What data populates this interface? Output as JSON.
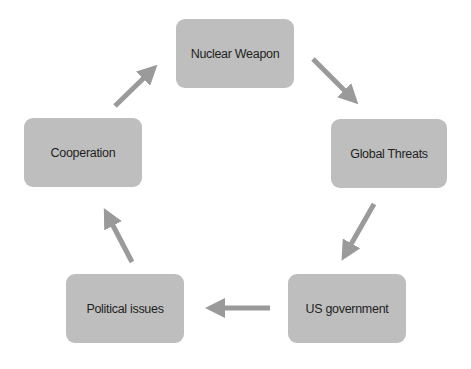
{
  "diagram": {
    "type": "cycle",
    "colors": {
      "node_fill": "#bebebe",
      "arrow": "#9a9a9a",
      "text": "#1e1e1e",
      "background": "#ffffff"
    },
    "nodes": [
      {
        "id": "nuclear",
        "label": "Nuclear Weapon",
        "x": 176,
        "y": 19,
        "w": 118,
        "h": 69
      },
      {
        "id": "global",
        "label": "Global Threats",
        "x": 331,
        "y": 119,
        "w": 116,
        "h": 69
      },
      {
        "id": "us",
        "label": "US government",
        "x": 288,
        "y": 274,
        "w": 118,
        "h": 69
      },
      {
        "id": "political",
        "label": "Political issues",
        "x": 66,
        "y": 274,
        "w": 118,
        "h": 69
      },
      {
        "id": "cooperation",
        "label": "Cooperation",
        "x": 24,
        "y": 118,
        "w": 118,
        "h": 69
      }
    ],
    "edges": [
      {
        "from": "nuclear",
        "to": "global"
      },
      {
        "from": "global",
        "to": "us"
      },
      {
        "from": "us",
        "to": "political"
      },
      {
        "from": "political",
        "to": "cooperation"
      },
      {
        "from": "cooperation",
        "to": "nuclear"
      }
    ]
  }
}
